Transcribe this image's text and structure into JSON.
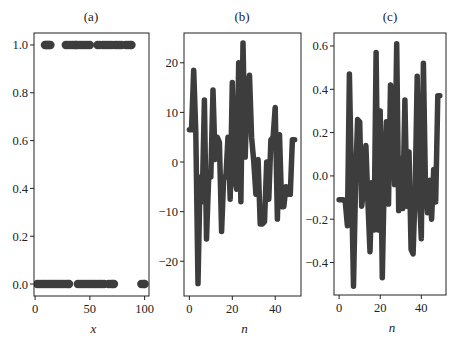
{
  "figure": {
    "background": "#ffffff",
    "series_color": "#3d3d3d",
    "frame_color": "#222222"
  },
  "chart_data": [
    {
      "panel": "(a)",
      "type": "scatter",
      "title": "(a)",
      "xlabel": "x",
      "ylabel": "",
      "xlim": [
        -1,
        104
      ],
      "ylim": [
        -0.05,
        1.05
      ],
      "xticks": [
        0,
        50,
        100
      ],
      "xtick_labels": [
        "0",
        "50",
        "100"
      ],
      "yticks": [
        0.0,
        0.2,
        0.4,
        0.6,
        0.8,
        1.0
      ],
      "ytick_labels": [
        "0.0",
        "0.2",
        "0.4",
        "0.6",
        "0.8",
        "1.0"
      ],
      "grid": false,
      "points": {
        "y1_x": [
          9,
          10,
          11,
          12,
          13,
          14,
          28,
          30,
          32,
          34,
          36,
          37,
          38,
          40,
          42,
          44,
          46,
          48,
          50,
          57,
          59,
          62,
          64,
          66,
          68,
          70,
          73,
          75,
          77,
          79,
          83,
          85,
          87,
          88
        ],
        "y0_x": [
          2,
          4,
          6,
          8,
          10,
          12,
          14,
          16,
          18,
          20,
          22,
          24,
          26,
          28,
          30,
          31,
          39,
          41,
          43,
          45,
          47,
          49,
          51,
          53,
          55,
          57,
          59,
          61,
          63,
          67,
          69,
          71,
          72,
          97,
          99,
          100
        ]
      }
    },
    {
      "panel": "(b)",
      "type": "line",
      "title": "(b)",
      "xlabel": "n",
      "ylabel": "",
      "xlim": [
        -2.5,
        52
      ],
      "ylim": [
        -27,
        26
      ],
      "xticks": [
        0,
        20,
        40
      ],
      "xtick_labels": [
        "0",
        "20",
        "40"
      ],
      "yticks": [
        -20,
        -10,
        0,
        10,
        20
      ],
      "ytick_labels": [
        "−20",
        "−10",
        "0",
        "10",
        "20"
      ],
      "grid": false,
      "x": [
        0,
        1,
        2,
        3,
        4,
        5,
        6,
        7,
        8,
        9,
        10,
        11,
        12,
        13,
        14,
        15,
        16,
        17,
        18,
        19,
        20,
        21,
        22,
        23,
        24,
        25,
        26,
        27,
        28,
        29,
        30,
        31,
        32,
        33,
        34,
        35,
        36,
        37,
        38,
        39,
        40,
        41,
        42,
        43,
        44,
        45,
        46,
        47,
        48,
        49
      ],
      "values": [
        6.5,
        6.5,
        18.5,
        6,
        -24.5,
        -3,
        -8,
        12.5,
        -15.5,
        -3,
        -3,
        14.5,
        0.5,
        5,
        4,
        -14,
        -3,
        -3,
        5,
        -7.5,
        16,
        -3,
        -5.5,
        20,
        -8,
        24,
        1,
        15,
        17.5,
        5,
        0,
        -6.5,
        0.5,
        -12.5,
        -12.5,
        -12,
        0,
        -7.5,
        4.5,
        5,
        11,
        -11.5,
        5.5,
        -9,
        -9,
        -5,
        -6.5,
        -6.5,
        4.5,
        4.5
      ]
    },
    {
      "panel": "(c)",
      "type": "line",
      "title": "(c)",
      "xlabel": "n",
      "ylabel": "",
      "xlim": [
        -2.5,
        52
      ],
      "ylim": [
        -0.55,
        0.66
      ],
      "xticks": [
        0,
        20,
        40
      ],
      "xtick_labels": [
        "0",
        "20",
        "40"
      ],
      "yticks": [
        -0.4,
        -0.2,
        0.0,
        0.2,
        0.4,
        0.6
      ],
      "ytick_labels": [
        "−0.4",
        "−0.2",
        "0.0",
        "0.2",
        "0.4",
        "0.6"
      ],
      "grid": false,
      "x": [
        0,
        1,
        2,
        3,
        4,
        5,
        6,
        7,
        8,
        9,
        10,
        11,
        12,
        13,
        14,
        15,
        16,
        17,
        18,
        19,
        20,
        21,
        22,
        23,
        24,
        25,
        26,
        27,
        28,
        29,
        30,
        31,
        32,
        33,
        34,
        35,
        36,
        37,
        38,
        39,
        40,
        41,
        42,
        43,
        44,
        45,
        46,
        47,
        48,
        49
      ],
      "values": [
        -0.11,
        -0.11,
        -0.11,
        -0.12,
        -0.23,
        0.47,
        -0.03,
        -0.51,
        -0.03,
        0.26,
        0.25,
        -0.14,
        -0.05,
        0.14,
        -0.12,
        -0.35,
        -0.03,
        -0.25,
        0.57,
        -0.25,
        0.3,
        -0.47,
        0.0,
        0.25,
        -0.13,
        0.42,
        0.23,
        -0.04,
        0.61,
        -0.16,
        0.08,
        -0.15,
        0.35,
        -0.14,
        0.11,
        -0.34,
        -0.36,
        -0.06,
        0.46,
        -0.08,
        -0.29,
        0.52,
        -0.03,
        -0.17,
        -0.02,
        -0.2,
        0.03,
        -0.12,
        0.37,
        0.37
      ]
    }
  ]
}
